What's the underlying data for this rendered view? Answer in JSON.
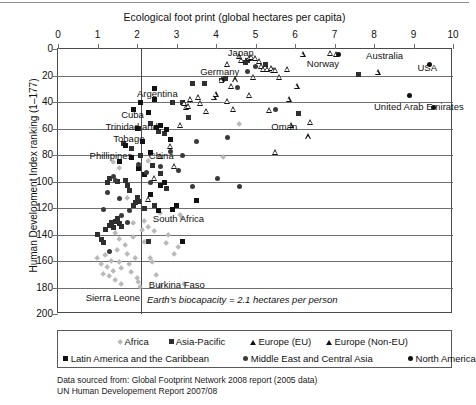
{
  "chart_data": {
    "type": "scatter",
    "title": "",
    "xlabel": "Ecological foot print (global hectares per capita)",
    "ylabel": "Human Development Index ranking (1–177)",
    "xlim": [
      0,
      10
    ],
    "ylim": [
      0,
      200
    ],
    "y_inverted": true,
    "xticks": [
      0,
      1,
      2,
      3,
      4,
      5,
      6,
      7,
      8,
      9,
      10
    ],
    "yticks": [
      0,
      20,
      40,
      60,
      80,
      100,
      120,
      140,
      160,
      180,
      200
    ],
    "grid": "horizontal-only",
    "reference_line": {
      "axis": "x",
      "value": 2.1,
      "label": "Earth's biocapacity = 2.1 hectares per person"
    },
    "legend_position": "below-plot",
    "series": [
      {
        "name": "Africa",
        "marker": "diamond",
        "color": "#b9b9b9",
        "points": [
          [
            1.0,
            158
          ],
          [
            1.1,
            163
          ],
          [
            1.15,
            170
          ],
          [
            1.2,
            156
          ],
          [
            1.25,
            165
          ],
          [
            1.3,
            172
          ],
          [
            1.35,
            160
          ],
          [
            1.4,
            168
          ],
          [
            1.45,
            175
          ],
          [
            1.5,
            152
          ],
          [
            1.55,
            161
          ],
          [
            1.6,
            166
          ],
          [
            1.62,
            178
          ],
          [
            1.7,
            148
          ],
          [
            1.75,
            155
          ],
          [
            1.8,
            163
          ],
          [
            1.85,
            169
          ],
          [
            1.9,
            142
          ],
          [
            1.95,
            158
          ],
          [
            2.0,
            173
          ],
          [
            2.05,
            176
          ],
          [
            2.1,
            180
          ],
          [
            2.15,
            137
          ],
          [
            2.2,
            146
          ],
          [
            2.3,
            135
          ],
          [
            2.35,
            158
          ],
          [
            2.4,
            161
          ],
          [
            2.5,
            171
          ],
          [
            2.6,
            179
          ],
          [
            2.75,
            147
          ],
          [
            2.8,
            141
          ],
          [
            2.95,
            155
          ],
          [
            3.05,
            150
          ],
          [
            3.1,
            126
          ],
          [
            3.15,
            128
          ],
          [
            3.2,
            178
          ],
          [
            1.35,
            133
          ],
          [
            1.45,
            139
          ],
          [
            1.55,
            144
          ],
          [
            1.9,
            132
          ],
          [
            2.2,
            130
          ],
          [
            2.45,
            138
          ],
          [
            4.6,
            57
          ],
          [
            4.2,
            82
          ],
          [
            2.3,
            85
          ],
          [
            1.4,
            86
          ],
          [
            1.55,
            90
          ],
          [
            1.75,
            113
          ],
          [
            2.6,
            124
          ]
        ]
      },
      {
        "name": "Asia-Pacific",
        "marker": "square",
        "color": "#2f2f2f",
        "points": [
          [
            1.0,
            140
          ],
          [
            1.1,
            144
          ],
          [
            1.15,
            146
          ],
          [
            1.2,
            136
          ],
          [
            1.3,
            133
          ],
          [
            1.35,
            131
          ],
          [
            1.4,
            135
          ],
          [
            1.45,
            130
          ],
          [
            1.5,
            128
          ],
          [
            1.55,
            132
          ],
          [
            1.6,
            134
          ],
          [
            1.7,
            99
          ],
          [
            1.75,
            103
          ],
          [
            1.8,
            107
          ],
          [
            1.9,
            118
          ],
          [
            1.95,
            116
          ],
          [
            2.0,
            112
          ],
          [
            2.05,
            115
          ],
          [
            2.2,
            120
          ],
          [
            2.3,
            145
          ],
          [
            2.45,
            118
          ],
          [
            2.1,
            80
          ],
          [
            2.4,
            88
          ],
          [
            2.6,
            94
          ],
          [
            2.75,
            105
          ],
          [
            1.65,
            71
          ],
          [
            1.85,
            75
          ],
          [
            2.05,
            60
          ],
          [
            2.35,
            56
          ],
          [
            2.55,
            62
          ],
          [
            2.7,
            64
          ],
          [
            2.9,
            40
          ],
          [
            3.15,
            40
          ],
          [
            3.3,
            52
          ],
          [
            3.4,
            26
          ],
          [
            3.7,
            26
          ],
          [
            4.15,
            24
          ],
          [
            4.25,
            22
          ],
          [
            4.75,
            10
          ],
          [
            4.8,
            9
          ],
          [
            5.25,
            12
          ],
          [
            7.6,
            19
          ],
          [
            6.1,
            49
          ],
          [
            1.5,
            100
          ],
          [
            1.25,
            101
          ],
          [
            1.3,
            98
          ]
        ]
      },
      {
        "name": "Europe (EU)",
        "marker": "triangle",
        "color": "#111111",
        "points": [
          [
            4.3,
            11
          ],
          [
            4.6,
            5
          ],
          [
            4.65,
            8
          ],
          [
            4.85,
            7
          ],
          [
            4.9,
            6
          ],
          [
            5.0,
            7
          ],
          [
            5.1,
            9
          ],
          [
            5.15,
            13
          ],
          [
            5.2,
            15
          ],
          [
            5.3,
            15
          ],
          [
            5.4,
            14
          ],
          [
            5.45,
            16
          ],
          [
            5.5,
            16
          ],
          [
            5.8,
            15
          ],
          [
            4.95,
            21
          ],
          [
            4.5,
            23
          ],
          [
            4.4,
            28
          ],
          [
            4.15,
            23
          ],
          [
            3.95,
            36
          ],
          [
            3.55,
            36
          ],
          [
            3.35,
            38
          ],
          [
            3.2,
            41
          ],
          [
            3.25,
            44
          ],
          [
            3.3,
            43
          ],
          [
            3.6,
            41
          ],
          [
            3.75,
            47
          ],
          [
            4.0,
            34
          ],
          [
            4.3,
            39
          ],
          [
            6.05,
            28
          ],
          [
            5.85,
            38
          ],
          [
            5.35,
            46
          ],
          [
            5.9,
            57
          ],
          [
            6.4,
            55
          ],
          [
            7.05,
            4
          ],
          [
            8.1,
            17
          ],
          [
            6.35,
            66
          ],
          [
            3.1,
            57
          ],
          [
            2.6,
            81
          ],
          [
            2.85,
            73
          ],
          [
            2.95,
            88
          ],
          [
            2.45,
            97
          ],
          [
            2.3,
            113
          ],
          [
            5.5,
            78
          ]
        ]
      },
      {
        "name": "Europe (Non-EU)",
        "marker": "triangle",
        "color": "#111111",
        "points": [
          [
            6.2,
            4
          ],
          [
            6.9,
            3
          ],
          [
            5.6,
            21
          ],
          [
            4.45,
            45
          ],
          [
            4.85,
            35
          ]
        ]
      },
      {
        "name": "Latin America and the Caribbean",
        "marker": "square",
        "color": "#111111",
        "points": [
          [
            1.9,
            46
          ],
          [
            2.3,
            48
          ],
          [
            2.5,
            59
          ],
          [
            2.45,
            38
          ],
          [
            2.0,
            60
          ],
          [
            2.15,
            70
          ],
          [
            2.6,
            58
          ],
          [
            2.75,
            61
          ],
          [
            2.85,
            68
          ],
          [
            2.35,
            78
          ],
          [
            2.05,
            90
          ],
          [
            1.85,
            82
          ],
          [
            2.2,
            95
          ],
          [
            2.6,
            103
          ],
          [
            3.0,
            118
          ],
          [
            2.35,
            110
          ],
          [
            2.55,
            122
          ],
          [
            2.9,
            121
          ],
          [
            3.5,
            114
          ],
          [
            3.15,
            145
          ],
          [
            1.55,
            85
          ],
          [
            1.7,
            73
          ],
          [
            2.45,
            30
          ],
          [
            2.1,
            40
          ],
          [
            2.7,
            101
          ]
        ]
      },
      {
        "name": "Middle East and Central Asia",
        "marker": "circle",
        "color": "#3a3a3a",
        "points": [
          [
            1.4,
            96
          ],
          [
            1.45,
            99
          ],
          [
            1.25,
            108
          ],
          [
            1.55,
            113
          ],
          [
            1.8,
            122
          ],
          [
            1.6,
            126
          ],
          [
            1.3,
            153
          ],
          [
            2.05,
            87
          ],
          [
            2.25,
            93
          ],
          [
            2.35,
            101
          ],
          [
            2.6,
            89
          ],
          [
            2.85,
            77
          ],
          [
            3.05,
            92
          ],
          [
            3.5,
            70
          ],
          [
            3.4,
            104
          ],
          [
            4.05,
            98
          ],
          [
            4.6,
            104
          ],
          [
            3.15,
            80
          ],
          [
            4.3,
            67
          ],
          [
            1.15,
            121
          ],
          [
            1.75,
            131
          ],
          [
            5.5,
            46
          ],
          [
            4.8,
            17
          ],
          [
            5.0,
            13
          ],
          [
            4.55,
            29
          ]
        ]
      },
      {
        "name": "North America",
        "marker": "circle",
        "color": "#111111",
        "points": [
          [
            7.1,
            4
          ],
          [
            9.4,
            12
          ],
          [
            8.9,
            35
          ],
          [
            9.5,
            44
          ]
        ]
      }
    ],
    "annotations": [
      {
        "text": "Japan",
        "x": 4.3,
        "y": 3
      },
      {
        "text": "Germany",
        "x": 3.6,
        "y": 17
      },
      {
        "text": "Norway",
        "x": 6.3,
        "y": 11
      },
      {
        "text": "Australia",
        "x": 7.8,
        "y": 5
      },
      {
        "text": "USA",
        "x": 9.1,
        "y": 14
      },
      {
        "text": "United Arab Emirates",
        "x": 8.0,
        "y": 44
      },
      {
        "text": "Argentina",
        "x": 2.0,
        "y": 34
      },
      {
        "text": "Cuba",
        "x": 1.6,
        "y": 50
      },
      {
        "text": "Trinidad and",
        "x": 1.2,
        "y": 59
      },
      {
        "text": "Tobago",
        "x": 1.4,
        "y": 68
      },
      {
        "text": "Phillipines",
        "x": 0.8,
        "y": 81
      },
      {
        "text": "China",
        "x": 2.3,
        "y": 81
      },
      {
        "text": "Oman",
        "x": 5.4,
        "y": 59
      },
      {
        "text": "South Africa",
        "x": 2.4,
        "y": 128
      },
      {
        "text": "Burkina Faso",
        "x": 2.3,
        "y": 178
      },
      {
        "text": "Sierra Leone",
        "x": 0.7,
        "y": 188
      }
    ]
  },
  "axis": {
    "x_title": "Ecological foot print (global hectares per capita)",
    "y_title": "Human Development Index ranking (1–177)",
    "x_tick_labels": [
      "0",
      "1",
      "2",
      "3",
      "4",
      "5",
      "6",
      "7",
      "8",
      "9",
      "10"
    ],
    "y_tick_labels": [
      "0",
      "20",
      "40",
      "60",
      "80",
      "100",
      "120",
      "140",
      "160",
      "180",
      "200"
    ]
  },
  "biocapacity_note": "Earth's biocapacity = 2.1 hectares per person",
  "legend": {
    "row1": [
      {
        "label": "Africa",
        "marker": "diamond",
        "color": "#b9b9b9"
      },
      {
        "label": "Asia-Pacific",
        "marker": "square",
        "color": "#2f2f2f"
      },
      {
        "label": "Europe (EU)",
        "marker": "triangle",
        "color": "#111111"
      },
      {
        "label": "Europe (Non-EU)",
        "marker": "triangle",
        "color": "#111111"
      }
    ],
    "row2": [
      {
        "label": "Latin America and the Caribbean",
        "marker": "square",
        "color": "#111111"
      },
      {
        "label": "Middle East and Central Asia",
        "marker": "circle",
        "color": "#3a3a3a"
      },
      {
        "label": "North America",
        "marker": "circle",
        "color": "#111111"
      }
    ]
  },
  "source": {
    "line1": "Data sourced from: Global Footprint Network 2008 report (2005 data)",
    "line2": "UN Human Developement Report 2007/08"
  }
}
